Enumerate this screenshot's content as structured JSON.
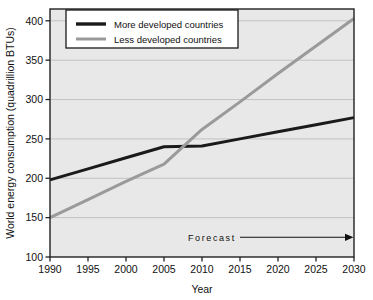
{
  "chart_data": {
    "type": "line",
    "title": "",
    "xlabel": "Year",
    "ylabel": "World energy consumption (quadrillion BTUs)",
    "xlim": [
      1990,
      2030
    ],
    "ylim": [
      100,
      415
    ],
    "xticks": [
      1990,
      1995,
      2000,
      2005,
      2010,
      2015,
      2020,
      2025,
      2030
    ],
    "yticks": [
      100,
      150,
      200,
      250,
      300,
      350,
      400
    ],
    "xticklabels": [
      "1990",
      "1995",
      "2000",
      "2005",
      "2010",
      "2015",
      "2020",
      "2025",
      "2030"
    ],
    "yticklabels": [
      "100",
      "150",
      "200",
      "250",
      "300",
      "350",
      "400"
    ],
    "grid": "horizontal",
    "legend_position": "top-left-inside",
    "plot_background": "#e8e8e8",
    "figure_background": "#ffffff",
    "x": [
      1990,
      1995,
      2000,
      2005,
      2010,
      2015,
      2020,
      2025,
      2030
    ],
    "series": [
      {
        "name": "More developed countries",
        "color": "#1a1a1a",
        "linewidth": 3,
        "values": [
          198,
          212,
          226,
          240,
          241,
          250,
          259,
          268,
          277
        ]
      },
      {
        "name": "Less developed countries",
        "color": "#9a9a9a",
        "linewidth": 3,
        "values": [
          150,
          173,
          196,
          218,
          262,
          297,
          333,
          368,
          403
        ]
      }
    ],
    "annotations": [
      {
        "text": "Forecast",
        "x_start": 2015,
        "x_end": 2030,
        "y": 125,
        "arrow": "right"
      }
    ]
  },
  "legend": {
    "items": [
      {
        "label": "More developed countries",
        "swatch_color": "#1a1a1a"
      },
      {
        "label": "Less developed countries",
        "swatch_color": "#9a9a9a"
      }
    ]
  },
  "axes": {
    "x_title": "Year",
    "y_title": "World energy consumption (quadrillion BTUs)",
    "x_labels": [
      "1990",
      "1995",
      "2000",
      "2005",
      "2010",
      "2015",
      "2020",
      "2025",
      "2030"
    ],
    "y_labels": [
      "100",
      "150",
      "200",
      "250",
      "300",
      "350",
      "400"
    ]
  },
  "annotation": {
    "forecast_label": "Forecast"
  }
}
